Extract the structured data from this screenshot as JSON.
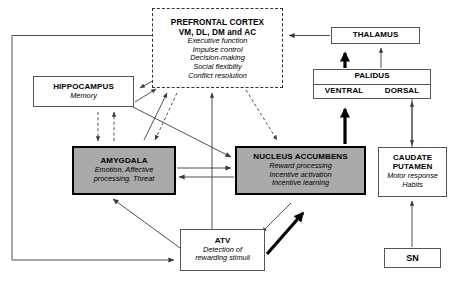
{
  "diagram": {
    "nodes": {
      "prefrontal_cortex": {
        "title_line1": "PREFRONTAL CORTEX",
        "title_line2": "VM, DL, DM and AC",
        "functions": [
          "Executive function",
          "Impulse control",
          "Decision-making",
          "Social flexiblity",
          "Conflict resolution"
        ],
        "border_style": "dashed",
        "fill": "#ffffff"
      },
      "hippocampus": {
        "title": "HIPPOCAMPUS",
        "functions": [
          "Memory"
        ],
        "fill": "#ffffff"
      },
      "amygdala": {
        "title": "AMYGDALA",
        "functions": [
          "Emotion, Affective",
          "processing. Threat"
        ],
        "fill": "#a9a9a9"
      },
      "nucleus_accumbens": {
        "title": "NUCLEUS ACCUMBENS",
        "functions": [
          "Reward processing",
          "Incentive activation",
          "Incentive learning"
        ],
        "fill": "#a9a9a9"
      },
      "caudate_putamen": {
        "title_line1": "CAUDATE",
        "title_line2": "PUTAMEN",
        "functions": [
          "Motor response",
          "Habits"
        ],
        "fill": "#ffffff"
      },
      "thalamus": {
        "title": "THALAMUS",
        "fill": "#ffffff"
      },
      "palidus": {
        "title": "PALIDUS",
        "ventral": "VENTRAL",
        "dorsal": "DORSAL",
        "fill": "#ffffff"
      },
      "atv": {
        "title": "ATV",
        "functions": [
          "Detection of",
          "rewarding stimuli"
        ],
        "fill": "#ffffff"
      },
      "sn": {
        "title": "SN",
        "fill": "#ffffff"
      }
    },
    "colors": {
      "shaded_node_fill": "#a9a9a9",
      "node_border": "#555555",
      "emphasis_border": "#000000",
      "connector": "#444444",
      "text": "#000000"
    },
    "connectors": [
      {
        "from": "prefrontal_cortex",
        "to": "thalamus",
        "style": "solid",
        "note": "thalamus to pfc"
      },
      {
        "from": "prefrontal_cortex",
        "to": "hippocampus",
        "style": "solid"
      },
      {
        "from": "hippocampus",
        "to": "prefrontal_cortex",
        "style": "solid"
      },
      {
        "from": "prefrontal_cortex",
        "to": "amygdala",
        "style": "dashed"
      },
      {
        "from": "amygdala",
        "to": "prefrontal_cortex",
        "style": "solid"
      },
      {
        "from": "prefrontal_cortex",
        "to": "nucleus_accumbens",
        "style": "dashed"
      },
      {
        "from": "hippocampus",
        "to": "amygdala",
        "style": "dashed"
      },
      {
        "from": "amygdala",
        "to": "hippocampus",
        "style": "dashed"
      },
      {
        "from": "hippocampus",
        "to": "nucleus_accumbens",
        "style": "solid"
      },
      {
        "from": "amygdala",
        "to": "nucleus_accumbens",
        "style": "solid"
      },
      {
        "from": "nucleus_accumbens",
        "to": "amygdala",
        "style": "solid"
      },
      {
        "from": "atv",
        "to": "prefrontal_cortex",
        "style": "solid"
      },
      {
        "from": "atv",
        "to": "amygdala",
        "style": "solid"
      },
      {
        "from": "atv",
        "to": "nucleus_accumbens",
        "style": "thick"
      },
      {
        "from": "nucleus_accumbens",
        "to": "atv",
        "style": "solid"
      },
      {
        "from": "prefrontal_cortex",
        "to": "atv",
        "style": "solid",
        "note": "long left loop"
      },
      {
        "from": "nucleus_accumbens",
        "to": "palidus",
        "style": "thick"
      },
      {
        "from": "caudate_putamen",
        "to": "palidus",
        "style": "solid"
      },
      {
        "from": "palidus",
        "to": "thalamus",
        "style": "thick"
      },
      {
        "from": "palidus",
        "to": "thalamus",
        "style": "solid"
      },
      {
        "from": "sn",
        "to": "caudate_putamen",
        "style": "solid"
      },
      {
        "from": "prefrontal_cortex",
        "to": "caudate_putamen",
        "style": "solid"
      }
    ]
  }
}
